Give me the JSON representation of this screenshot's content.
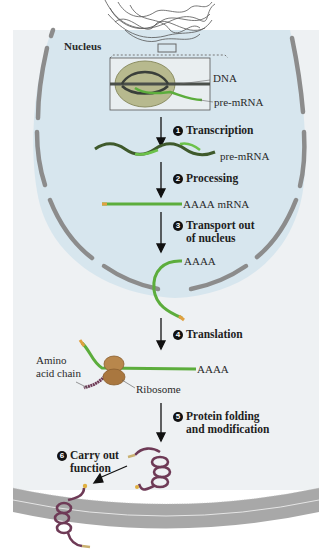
{
  "colors": {
    "background": "#ffffff",
    "cytoplasm": "#eef1f3",
    "nucleoplasm": "#d7e6ee",
    "nuclear_envelope": "#8c8c8c",
    "dna": "#4a4f4a",
    "rna": "#5cad3c",
    "rna_5prime_cap": "#e0a040",
    "ribosome": "#b8874c",
    "protein": "#6e3a56",
    "membrane": "#a8a8a8"
  },
  "labels": {
    "nucleus": "Nucleus",
    "dna": "DNA",
    "pre_mrna_inset": "pre-mRNA",
    "pre_mrna": "pre-mRNA",
    "mrna_tail": "AAAA",
    "mrna": "mRNA",
    "exported_tail": "AAAA",
    "translation_tail": "AAAA",
    "amino_acid_chain_line1": "Amino",
    "amino_acid_chain_line2": "acid chain",
    "ribosome": "Ribosome"
  },
  "steps": [
    {
      "number": "1",
      "text": "Transcription"
    },
    {
      "number": "2",
      "text": "Processing"
    },
    {
      "number": "3",
      "line1": "Transport out",
      "line2": "of nucleus"
    },
    {
      "number": "4",
      "text": "Translation"
    },
    {
      "number": "5",
      "line1": "Protein folding",
      "line2": "and modification"
    },
    {
      "number": "6",
      "line1": "Carry out",
      "line2": "function"
    }
  ]
}
